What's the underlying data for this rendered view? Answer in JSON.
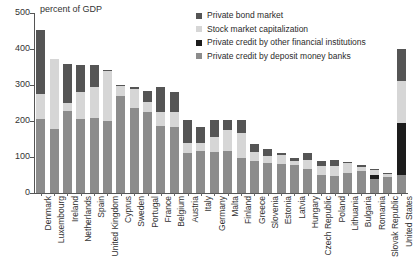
{
  "chart_data": {
    "type": "bar",
    "subtype": "stacked-bar",
    "title": "",
    "xlabel": "",
    "ylabel": "percent of GDP",
    "ylim": [
      0,
      500
    ],
    "yticks": [
      0,
      100,
      200,
      300,
      400,
      500
    ],
    "grid": false,
    "legend_position": "top-right",
    "categories": [
      "Denmark",
      "Luxembourg",
      "Ireland",
      "Netherlands",
      "Spain",
      "United Kingdom",
      "Cyprus",
      "Sweden",
      "Portugal",
      "France",
      "Belgium",
      "Austria",
      "Italy",
      "Germany",
      "Malta",
      "Finland",
      "Greece",
      "Slovenia",
      "Estonia",
      "Latvia",
      "Hungary",
      "Czech Republic",
      "Poland",
      "Lithuania",
      "Bulgaria",
      "Romania",
      "Slovak Republic",
      "United States"
    ],
    "series": [
      {
        "name": "Private credit by deposit money banks",
        "color": "#8c8c8c",
        "values": [
          205,
          178,
          228,
          205,
          207,
          200,
          270,
          235,
          224,
          185,
          182,
          110,
          116,
          113,
          116,
          98,
          88,
          82,
          80,
          78,
          66,
          50,
          48,
          56,
          62,
          38,
          44,
          50
        ]
      },
      {
        "name": "Private credit by other financial institutions",
        "color": "#1c1c1c",
        "values": [
          0,
          0,
          0,
          0,
          0,
          0,
          0,
          0,
          0,
          0,
          0,
          0,
          0,
          0,
          0,
          0,
          0,
          0,
          0,
          0,
          0,
          0,
          0,
          0,
          0,
          12,
          0,
          145
        ]
      },
      {
        "name": "Stock market capitalization",
        "color": "#d6d6d6",
        "values": [
          70,
          194,
          21,
          75,
          88,
          140,
          26,
          55,
          30,
          40,
          44,
          30,
          22,
          44,
          60,
          68,
          26,
          22,
          26,
          10,
          26,
          24,
          28,
          26,
          10,
          14,
          8,
          115
        ]
      },
      {
        "name": "Private bond market",
        "color": "#555555",
        "values": [
          177,
          0,
          110,
          76,
          60,
          2,
          4,
          4,
          30,
          69,
          56,
          64,
          45,
          45,
          28,
          38,
          22,
          18,
          4,
          10,
          18,
          14,
          16,
          4,
          6,
          4,
          4,
          90
        ]
      }
    ],
    "legend": [
      {
        "label": "Private bond market",
        "color": "#555555"
      },
      {
        "label": "Stock market capitalization",
        "color": "#d6d6d6"
      },
      {
        "label": "Private credit by other financial institutions",
        "color": "#1c1c1c"
      },
      {
        "label": "Private credit by deposit money banks",
        "color": "#8c8c8c"
      }
    ],
    "totals": [
      452,
      372,
      359,
      356,
      355,
      342,
      300,
      294,
      284,
      294,
      282,
      204,
      183,
      202,
      204,
      204,
      136,
      122,
      110,
      98,
      110,
      88,
      92,
      86,
      78,
      68,
      56,
      400
    ]
  }
}
